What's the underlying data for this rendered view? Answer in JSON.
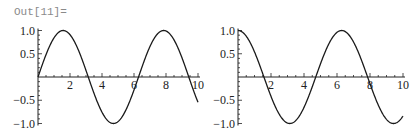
{
  "output_label": "Out[11]=",
  "chart_data": [
    {
      "type": "line",
      "title": "",
      "function": "sin(x)",
      "x_range": [
        0,
        10
      ],
      "ylim": [
        -1.0,
        1.0
      ],
      "x_ticks": [
        "2",
        "4",
        "6",
        "8",
        "10"
      ],
      "y_ticks": [
        "1.0",
        "0.5",
        "-0.5",
        "-1.0"
      ],
      "xlabel": "",
      "ylabel": "",
      "grid": false,
      "legend": null
    },
    {
      "type": "line",
      "title": "",
      "function": "cos(x)",
      "x_range": [
        0,
        10
      ],
      "ylim": [
        -1.0,
        1.0
      ],
      "x_ticks": [
        "2",
        "4",
        "6",
        "8",
        "10"
      ],
      "y_ticks": [
        "1.0",
        "0.5",
        "-0.5",
        "-1.0"
      ],
      "xlabel": "",
      "ylabel": "",
      "grid": false,
      "legend": null
    }
  ],
  "colors": {
    "curve": "#1a1a1a",
    "axis": "#222222",
    "label": "#8a8a8a"
  }
}
